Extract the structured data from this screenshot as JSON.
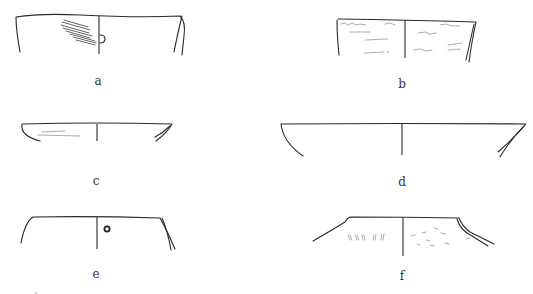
{
  "figure": {
    "type": "pottery rim profile drawings",
    "line_color": "#2a2a2a",
    "background": "#ffffff",
    "panels": [
      {
        "id": "a",
        "label": "a",
        "description": "straight-walled rim with diagonal hatching on the exterior left and a small lug/knob on the central axis"
      },
      {
        "id": "b",
        "label": "b",
        "description": "straight-walled rim with faint incised/painted marks on both halves, double-lined right profile"
      },
      {
        "id": "c",
        "label": "c",
        "description": "shallow dish rim, incurving walls, faint horizontal lines on the left"
      },
      {
        "id": "d",
        "label": "d",
        "description": "wide shallow bowl rim with curved left wall and double-lined right profile"
      },
      {
        "id": "e",
        "label": "e",
        "description": "straight-walled rim with a small circular perforation right of the axis, double-lined right profile"
      },
      {
        "id": "f",
        "label": "f",
        "description": "flaring neck with sloping shoulders, impressed marks on the left and scattered dashes on the right"
      }
    ]
  }
}
